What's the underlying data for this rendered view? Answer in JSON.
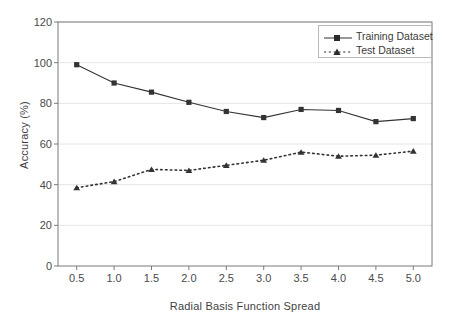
{
  "chart_data": {
    "type": "line",
    "title": "",
    "xlabel": "Radial Basis Function Spread",
    "ylabel": "Accuracy (%)",
    "x": [
      0.5,
      1.0,
      1.5,
      2.0,
      2.5,
      3.0,
      3.5,
      4.0,
      4.5,
      5.0
    ],
    "xticklabels": [
      "0.5",
      "1.0",
      "1.5",
      "2.0",
      "2.5",
      "3.0",
      "3.5",
      "4.0",
      "4.5",
      "5.0"
    ],
    "yticklabels": [
      "0",
      "20",
      "40",
      "60",
      "80",
      "100",
      "120"
    ],
    "yticks": [
      0,
      20,
      40,
      60,
      80,
      100,
      120
    ],
    "ylim": [
      0,
      120
    ],
    "xlim": [
      0.25,
      5.25
    ],
    "grid": "horizontal",
    "legend_position": "top-right",
    "series": [
      {
        "name": "Training Dataset",
        "values": [
          99,
          90,
          85.5,
          80.5,
          76,
          73,
          77,
          76.5,
          71,
          72.5
        ],
        "line_style": "solid",
        "marker": "square",
        "color": "#333333"
      },
      {
        "name": "Test Dataset",
        "values": [
          38.5,
          41.5,
          47.5,
          47,
          49.5,
          52,
          56,
          54,
          54.5,
          56.5
        ],
        "line_style": "dotted",
        "marker": "triangle",
        "color": "#333333"
      }
    ]
  },
  "legend": {
    "items": [
      {
        "label": "Training Dataset"
      },
      {
        "label": "Test Dataset"
      }
    ]
  },
  "colors": {
    "axis": "#7a7a7a",
    "grid": "#e4e4e4",
    "series": "#333333",
    "text": "#3a3a3a",
    "background": "#ffffff"
  }
}
